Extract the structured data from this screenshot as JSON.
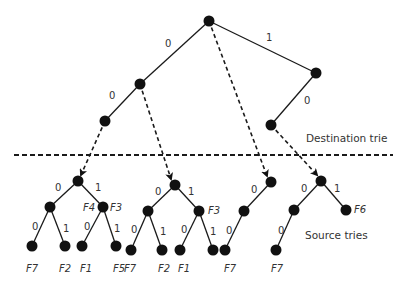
{
  "labels": {
    "destination": "Destination trie",
    "source": "Source tries"
  },
  "colors": {
    "ink": "#111111",
    "text": "#333333",
    "background": "#ffffff"
  },
  "destination_trie": {
    "nodes": [
      {
        "id": "d0",
        "x": 209,
        "y": 21
      },
      {
        "id": "d00",
        "x": 140,
        "y": 84
      },
      {
        "id": "d000",
        "x": 105,
        "y": 121
      },
      {
        "id": "d1",
        "x": 316,
        "y": 73
      },
      {
        "id": "d10",
        "x": 271,
        "y": 125
      }
    ],
    "edges": [
      {
        "from": "d0",
        "to": "d00",
        "label": "0",
        "lx": 165,
        "ly": 47
      },
      {
        "from": "d00",
        "to": "d000",
        "label": "0",
        "lx": 109,
        "ly": 99
      },
      {
        "from": "d0",
        "to": "d1",
        "label": "1",
        "lx": 266,
        "ly": 41
      },
      {
        "from": "d1",
        "to": "d10",
        "label": "0",
        "lx": 304,
        "ly": 104
      }
    ]
  },
  "pointers": [
    {
      "from": [
        105,
        121
      ],
      "to": [
        81,
        175
      ]
    },
    {
      "from": [
        140,
        84
      ],
      "to": [
        171,
        179
      ]
    },
    {
      "from": [
        209,
        21
      ],
      "to": [
        267,
        176
      ]
    },
    {
      "from": [
        271,
        125
      ],
      "to": [
        317,
        175
      ]
    }
  ],
  "divider": {
    "x1": 14,
    "x2": 393,
    "y": 155
  },
  "source_tries": [
    {
      "nodes": [
        {
          "id": "a",
          "x": 78,
          "y": 181
        },
        {
          "id": "a0",
          "x": 50,
          "y": 207
        },
        {
          "id": "a1",
          "x": 103,
          "y": 207
        },
        {
          "id": "a00",
          "x": 32,
          "y": 246
        },
        {
          "id": "a01",
          "x": 65,
          "y": 246
        },
        {
          "id": "a10",
          "x": 82,
          "y": 246
        },
        {
          "id": "a11",
          "x": 116,
          "y": 246
        }
      ],
      "edges": [
        {
          "from": "a",
          "to": "a0",
          "label": "0",
          "lx": 55,
          "ly": 191
        },
        {
          "from": "a",
          "to": "a1",
          "label": "1",
          "lx": 95,
          "ly": 191
        },
        {
          "from": "a0",
          "to": "a00",
          "label": "0",
          "lx": 32,
          "ly": 230
        },
        {
          "from": "a0",
          "to": "a01",
          "label": "1",
          "lx": 63,
          "ly": 232
        },
        {
          "from": "a1",
          "to": "a10",
          "label": "0",
          "lx": 84,
          "ly": 230
        },
        {
          "from": "a1",
          "to": "a11",
          "label": "1",
          "lx": 114,
          "ly": 232
        }
      ],
      "flags": [
        {
          "text": "F4",
          "x": 83,
          "y": 211
        },
        {
          "text": "F3",
          "x": 110,
          "y": 211
        },
        {
          "text": "F7",
          "x": 26,
          "y": 272
        },
        {
          "text": "F2",
          "x": 59,
          "y": 272
        },
        {
          "text": "F1",
          "x": 80,
          "y": 272
        },
        {
          "text": "F5",
          "x": 113,
          "y": 272
        }
      ]
    },
    {
      "nodes": [
        {
          "id": "b",
          "x": 175,
          "y": 185
        },
        {
          "id": "b0",
          "x": 148,
          "y": 211
        },
        {
          "id": "b1",
          "x": 199,
          "y": 211
        },
        {
          "id": "b00",
          "x": 131,
          "y": 250
        },
        {
          "id": "b01",
          "x": 162,
          "y": 250
        },
        {
          "id": "b10",
          "x": 180,
          "y": 250
        },
        {
          "id": "b11",
          "x": 213,
          "y": 250
        }
      ],
      "edges": [
        {
          "from": "b",
          "to": "b0",
          "label": "0",
          "lx": 155,
          "ly": 195
        },
        {
          "from": "b",
          "to": "b1",
          "label": "1",
          "lx": 188,
          "ly": 195
        },
        {
          "from": "b0",
          "to": "b00",
          "label": "0",
          "lx": 131,
          "ly": 233
        },
        {
          "from": "b0",
          "to": "b01",
          "label": "1",
          "lx": 160,
          "ly": 235
        },
        {
          "from": "b1",
          "to": "b10",
          "label": "0",
          "lx": 181,
          "ly": 233
        },
        {
          "from": "b1",
          "to": "b11",
          "label": "1",
          "lx": 210,
          "ly": 235
        }
      ],
      "flags": [
        {
          "text": "F3",
          "x": 208,
          "y": 214
        },
        {
          "text": "F7",
          "x": 124,
          "y": 272
        },
        {
          "text": "F2",
          "x": 158,
          "y": 272
        },
        {
          "text": "F1",
          "x": 178,
          "y": 272
        }
      ]
    },
    {
      "nodes": [
        {
          "id": "c",
          "x": 271,
          "y": 182
        },
        {
          "id": "c0",
          "x": 244,
          "y": 211
        },
        {
          "id": "c00",
          "x": 225,
          "y": 250
        }
      ],
      "edges": [
        {
          "from": "c",
          "to": "c0",
          "label": "0",
          "lx": 251,
          "ly": 193
        },
        {
          "from": "c0",
          "to": "c00",
          "label": "0",
          "lx": 226,
          "ly": 234
        }
      ],
      "flags": [
        {
          "text": "F7",
          "x": 224,
          "y": 272
        }
      ]
    },
    {
      "nodes": [
        {
          "id": "e",
          "x": 321,
          "y": 181
        },
        {
          "id": "e0",
          "x": 294,
          "y": 210
        },
        {
          "id": "e1",
          "x": 346,
          "y": 210
        },
        {
          "id": "e00",
          "x": 276,
          "y": 250
        }
      ],
      "edges": [
        {
          "from": "e",
          "to": "e0",
          "label": "0",
          "lx": 301,
          "ly": 192
        },
        {
          "from": "e",
          "to": "e1",
          "label": "1",
          "lx": 334,
          "ly": 192
        },
        {
          "from": "e0",
          "to": "e00",
          "label": "0",
          "lx": 278,
          "ly": 234
        }
      ],
      "flags": [
        {
          "text": "F6",
          "x": 354,
          "y": 213
        },
        {
          "text": "F7",
          "x": 271,
          "y": 272
        }
      ]
    }
  ]
}
